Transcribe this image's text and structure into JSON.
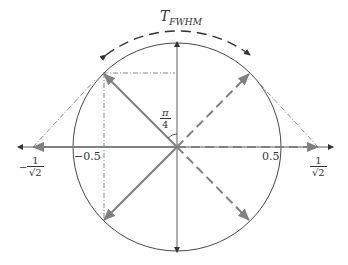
{
  "title": {
    "main": "T",
    "subscript": "FWHM"
  },
  "angle_label": {
    "num": "π",
    "den": "4"
  },
  "axis_labels": {
    "neg_half": "−0.5",
    "pos_half": "0.5",
    "neg_inv_sqrt2": {
      "sign": "−",
      "num": "1",
      "den": "√2"
    },
    "pos_inv_sqrt2": {
      "num": "1",
      "den": "√2"
    }
  },
  "colors": {
    "line": "#333333",
    "gray_arrow": "#808080"
  }
}
